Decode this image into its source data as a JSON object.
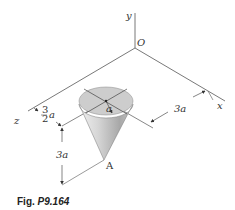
{
  "figure": {
    "caption_prefix": "Fig.",
    "caption_number": "P9.164"
  },
  "axes": {
    "y_label": "y",
    "x_label": "x",
    "z_label": "z",
    "origin_label": "O"
  },
  "body": {
    "type": "right circular cone (inverted, apex down)",
    "radius_label": "a",
    "apex_label": "A"
  },
  "dimensions": {
    "x_offset_label": "3a",
    "z_offset_num": "3",
    "z_offset_den": "2",
    "z_offset_var": "a",
    "height_label": "3a"
  },
  "colors": {
    "line": "#333333",
    "cone_light": "#e4e4e4",
    "cone_dark": "#9a9a9a",
    "top_face": "#c8c8c8"
  }
}
